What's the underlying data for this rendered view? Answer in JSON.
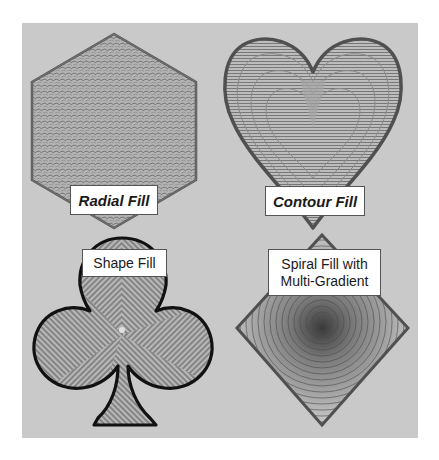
{
  "figure": {
    "background_color": "#c9c9c9",
    "outline_color": "#555555",
    "panels": [
      {
        "id": "radial",
        "shape": "hexagon",
        "label": "Radial Fill",
        "label_style": "bold-italic"
      },
      {
        "id": "contour",
        "shape": "heart",
        "label": "Contour Fill",
        "label_style": "bold-italic"
      },
      {
        "id": "shape",
        "shape": "club",
        "label": "Shape Fill",
        "label_style": "regular"
      },
      {
        "id": "spiral",
        "shape": "diamond",
        "label_lines": [
          "Spiral Fill with",
          "Multi-Gradient"
        ],
        "label_style": "regular"
      }
    ]
  }
}
